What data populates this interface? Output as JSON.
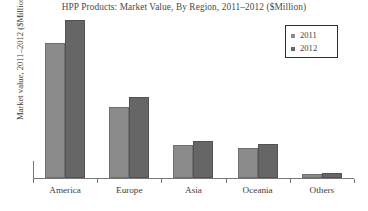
{
  "chart_data": {
    "type": "bar",
    "title": "HPP Products: Market Value, By Region, 2011–2012 ($Million)",
    "xlabel": "",
    "ylabel": "Market value, 2011–2012 ($Million)",
    "categories": [
      "America",
      "Europe",
      "Asia",
      "Oceania",
      "Others"
    ],
    "series": [
      {
        "name": "2011",
        "color": "#8b8b8b",
        "values": [
          135,
          71,
          33,
          30,
          4
        ]
      },
      {
        "name": "2012",
        "color": "#666666",
        "values": [
          158,
          81,
          37,
          34,
          5
        ]
      }
    ],
    "ylim": [
      0,
      162
    ],
    "grid": false,
    "legend_position": "top-right",
    "legend_entries": [
      "2011",
      "2012"
    ],
    "y_tick_labels": [],
    "axis_color": "#777777"
  },
  "legend": {
    "rows": [
      {
        "label": "2011"
      },
      {
        "label": "2012"
      }
    ]
  },
  "icons": {
    "swatch_2011": "legend-swatch-icon",
    "swatch_2012": "legend-swatch-icon"
  }
}
